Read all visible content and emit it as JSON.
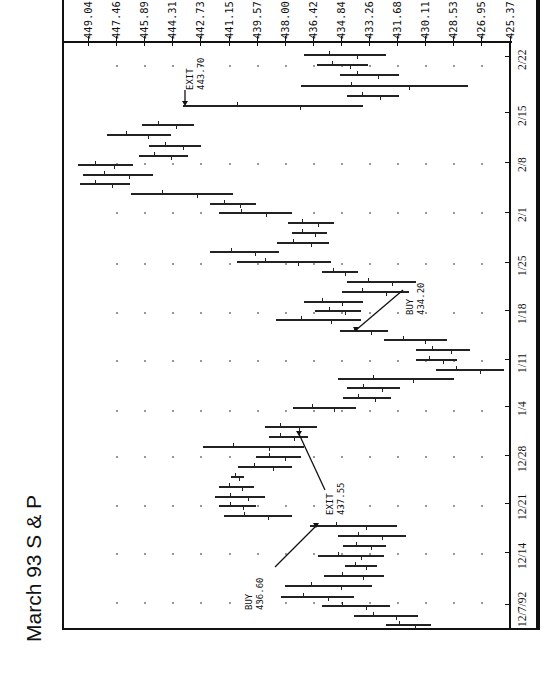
{
  "chart_data": {
    "type": "bar",
    "orientation": "rotated-90 (price axis across top, dates along right edge)",
    "title": "March 93 S & P",
    "xlabel": "Date",
    "ylabel": "Price",
    "price_ticks": [
      "449.04",
      "447.46",
      "445.89",
      "444.31",
      "442.73",
      "441.15",
      "439.57",
      "438.00",
      "436.42",
      "434.84",
      "433.26",
      "431.68",
      "430.11",
      "428.53",
      "426.95",
      "425.37"
    ],
    "date_ticks": [
      "2/22",
      "2/15",
      "2/8",
      "2/1",
      "1/25",
      "1/18",
      "1/11",
      "1/4",
      "12/28",
      "12/21",
      "12/14",
      "12/7/92"
    ],
    "ylim": [
      425.37,
      449.04
    ],
    "grid": "dotted",
    "annotations": [
      {
        "label": "EXIT",
        "value": "443.70"
      },
      {
        "label": "BUY",
        "value": "434.20"
      },
      {
        "label": "EXIT",
        "value": "437.55"
      },
      {
        "label": "BUY",
        "value": "436.60"
      }
    ],
    "series": [
      {
        "name": "daily range (high-low) by row, top = most recent",
        "bars": [
          {
            "row": 1,
            "high": 436.9,
            "low": 432.3
          },
          {
            "row": 2,
            "high": 436.2,
            "low": 433.3
          },
          {
            "row": 3,
            "high": 434.9,
            "low": 431.6
          },
          {
            "row": 4,
            "high": 437.1,
            "low": 427.7
          },
          {
            "row": 5,
            "high": 434.5,
            "low": 431.6
          },
          {
            "row": 6,
            "high": 443.7,
            "low": 433.6
          },
          {
            "row": 7,
            "high": 446.0,
            "low": 443.1
          },
          {
            "row": 8,
            "high": 448.0,
            "low": 444.4
          },
          {
            "row": 9,
            "high": 445.6,
            "low": 442.7
          },
          {
            "row": 10,
            "high": 446.2,
            "low": 443.4
          },
          {
            "row": 11,
            "high": 449.6,
            "low": 446.5
          },
          {
            "row": 12,
            "high": 449.3,
            "low": 445.4
          },
          {
            "row": 13,
            "high": 449.5,
            "low": 446.7
          },
          {
            "row": 14,
            "high": 446.6,
            "low": 440.9
          },
          {
            "row": 15,
            "high": 442.2,
            "low": 439.6
          },
          {
            "row": 16,
            "high": 441.7,
            "low": 437.6
          },
          {
            "row": 17,
            "high": 437.8,
            "low": 435.2
          },
          {
            "row": 18,
            "high": 437.6,
            "low": 435.6
          },
          {
            "row": 19,
            "high": 438.4,
            "low": 435.5
          },
          {
            "row": 20,
            "high": 442.2,
            "low": 438.3
          },
          {
            "row": 21,
            "high": 440.7,
            "low": 435.4
          },
          {
            "row": 22,
            "high": 435.9,
            "low": 433.9
          },
          {
            "row": 23,
            "high": 434.5,
            "low": 430.6
          },
          {
            "row": 24,
            "high": 434.8,
            "low": 431.0
          },
          {
            "row": 25,
            "high": 436.9,
            "low": 433.6
          },
          {
            "row": 26,
            "high": 436.3,
            "low": 433.7
          },
          {
            "row": 27,
            "high": 438.5,
            "low": 433.7
          },
          {
            "row": 28,
            "high": 434.9,
            "low": 432.2
          },
          {
            "row": 29,
            "high": 432.4,
            "low": 428.9
          },
          {
            "row": 30,
            "high": 430.6,
            "low": 427.6
          },
          {
            "row": 31,
            "high": 430.6,
            "low": 428.3
          },
          {
            "row": 32,
            "high": 429.5,
            "low": 425.7
          },
          {
            "row": 33,
            "high": 435.0,
            "low": 428.5
          },
          {
            "row": 34,
            "high": 434.5,
            "low": 431.5
          },
          {
            "row": 35,
            "high": 434.7,
            "low": 432.0
          },
          {
            "row": 36,
            "high": 437.5,
            "low": 434.0
          },
          {
            "row": 37,
            "high": 439.1,
            "low": 436.2
          },
          {
            "row": 38,
            "high": 438.9,
            "low": 436.7
          },
          {
            "row": 39,
            "high": 442.6,
            "low": 436.9
          },
          {
            "row": 40,
            "high": 439.6,
            "low": 437.1
          },
          {
            "row": 41,
            "high": 440.6,
            "low": 437.6
          },
          {
            "row": 42,
            "high": 441.0,
            "low": 440.3
          },
          {
            "row": 43,
            "high": 441.7,
            "low": 439.7
          },
          {
            "row": 44,
            "high": 441.9,
            "low": 439.1
          },
          {
            "row": 45,
            "high": 441.7,
            "low": 439.6
          },
          {
            "row": 46,
            "high": 441.4,
            "low": 437.6
          },
          {
            "row": 47,
            "high": 436.6,
            "low": 431.7
          },
          {
            "row": 48,
            "high": 435.0,
            "low": 431.2
          },
          {
            "row": 49,
            "high": 434.7,
            "low": 432.3
          },
          {
            "row": 50,
            "high": 436.1,
            "low": 432.4
          },
          {
            "row": 51,
            "high": 434.6,
            "low": 432.8
          },
          {
            "row": 52,
            "high": 435.8,
            "low": 432.4
          },
          {
            "row": 53,
            "high": 438.0,
            "low": 433.1
          },
          {
            "row": 54,
            "high": 438.2,
            "low": 434.1
          },
          {
            "row": 55,
            "high": 435.9,
            "low": 432.1
          },
          {
            "row": 56,
            "high": 434.1,
            "low": 430.5
          },
          {
            "row": 57,
            "high": 432.3,
            "low": 429.8
          }
        ]
      }
    ]
  },
  "title": "March 93 S & P"
}
